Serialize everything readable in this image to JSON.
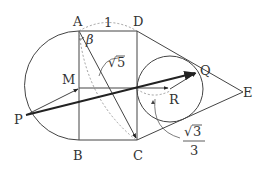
{
  "diagram": {
    "colors": {
      "stroke": "#444444",
      "dashed": "#888888",
      "text": "#333333",
      "background": "#ffffff"
    },
    "points": {
      "A": {
        "label": "A"
      },
      "B": {
        "label": "B"
      },
      "C": {
        "label": "C"
      },
      "D": {
        "label": "D"
      },
      "E": {
        "label": "E"
      },
      "M": {
        "label": "M"
      },
      "P": {
        "label": "P"
      },
      "Q": {
        "label": "Q"
      },
      "R": {
        "label": "R"
      }
    },
    "annotations": {
      "ad_length": "1",
      "ac_length_radical": "√",
      "ac_length_value": "5",
      "angle_label": "β",
      "radius_radical": "√",
      "radius_numerator": "3",
      "radius_denominator": "3"
    }
  }
}
